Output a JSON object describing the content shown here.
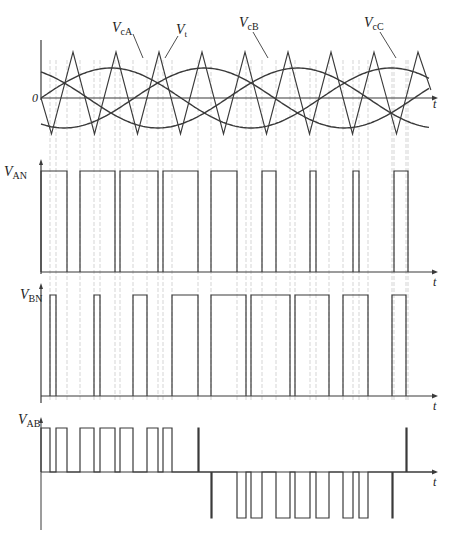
{
  "figure": {
    "colors": {
      "line": "#3a3a3a",
      "guide": "#b8b8b8",
      "background": "#ffffff"
    }
  },
  "labels": {
    "zero": "0",
    "t": "t",
    "vcA_main": "V",
    "vcA_sub": "cA",
    "vt_main": "V",
    "vt_sub": "t",
    "vcB_main": "V",
    "vcB_sub": "cB",
    "vcC_main": "V",
    "vcC_sub": "cC",
    "van_main": "V",
    "van_sub": "AN",
    "vbn_main": "V",
    "vbn_sub": "BN",
    "vab_main": "V",
    "vab_sub": "AB"
  },
  "panels": {
    "reference": {
      "x0": 41,
      "x1": 436,
      "zero_y": 98,
      "carrier_peak_y": 52,
      "carrier_trough_y": 134,
      "sine_amplitude": 30,
      "sine_period_px": 280,
      "carrier_peaks_x": [
        73,
        116,
        159,
        202,
        245,
        288,
        331,
        374,
        418
      ],
      "phase_shifts_deg": {
        "A": 0,
        "B": -120,
        "C": -240
      }
    },
    "van": {
      "base_y": 272,
      "high_y": 171,
      "pulses": [
        [
          41,
          67
        ],
        [
          80,
          115
        ],
        [
          120,
          158
        ],
        [
          163,
          198
        ],
        [
          211,
          237
        ],
        [
          262,
          276
        ],
        [
          310,
          316
        ],
        [
          353,
          359
        ],
        [
          394,
          408
        ]
      ]
    },
    "vbn": {
      "base_y": 396,
      "high_y": 295,
      "pulses": [
        [
          50,
          56
        ],
        [
          94,
          100
        ],
        [
          133,
          147
        ],
        [
          172,
          198
        ],
        [
          211,
          246
        ],
        [
          251,
          290
        ],
        [
          295,
          329
        ],
        [
          343,
          368
        ],
        [
          392,
          406
        ]
      ]
    },
    "vab": {
      "zero_y": 472,
      "high_y": 428,
      "low_y": 518,
      "segments": [
        [
          41,
          1
        ],
        [
          50,
          0
        ],
        [
          56,
          1
        ],
        [
          67,
          0
        ],
        [
          80,
          1
        ],
        [
          94,
          0
        ],
        [
          100,
          1
        ],
        [
          115,
          0
        ],
        [
          120,
          1
        ],
        [
          133,
          0
        ],
        [
          147,
          1
        ],
        [
          158,
          0
        ],
        [
          163,
          1
        ],
        [
          172,
          0
        ],
        [
          198,
          1
        ],
        [
          199,
          0
        ],
        [
          211,
          -1
        ],
        [
          212,
          0
        ],
        [
          237,
          -1
        ],
        [
          246,
          0
        ],
        [
          251,
          -1
        ],
        [
          262,
          0
        ],
        [
          276,
          -1
        ],
        [
          290,
          0
        ],
        [
          295,
          -1
        ],
        [
          310,
          0
        ],
        [
          316,
          -1
        ],
        [
          329,
          0
        ],
        [
          343,
          -1
        ],
        [
          353,
          0
        ],
        [
          359,
          -1
        ],
        [
          368,
          0
        ],
        [
          392,
          -1
        ],
        [
          393,
          0
        ],
        [
          406,
          1
        ],
        [
          407,
          0
        ],
        [
          436,
          0
        ]
      ]
    }
  }
}
